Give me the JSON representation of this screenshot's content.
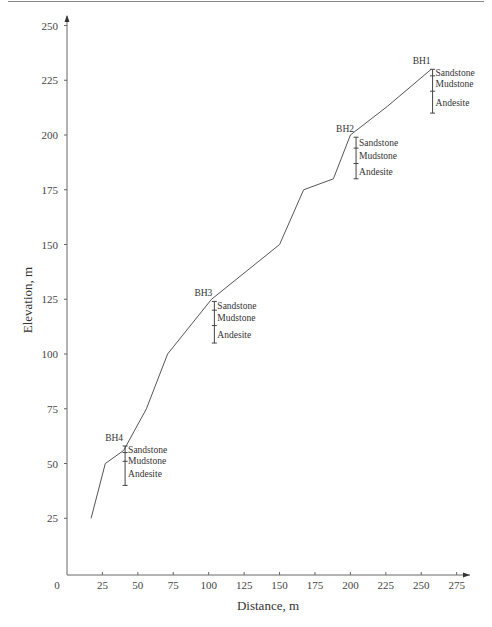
{
  "chart_data": {
    "type": "line",
    "title": "",
    "xlabel": "Distance, m",
    "ylabel": "Elevation, m",
    "xlim": [
      0,
      280
    ],
    "ylim": [
      0,
      250
    ],
    "x_ticks": [
      0,
      25,
      50,
      75,
      100,
      125,
      150,
      175,
      200,
      225,
      250,
      275
    ],
    "y_ticks": [
      25,
      50,
      75,
      100,
      125,
      150,
      175,
      200,
      225,
      250
    ],
    "grid": false,
    "series": [
      {
        "name": "Ground surface profile",
        "x": [
          17,
          27,
          40,
          56,
          71,
          102,
          150,
          167,
          188,
          200,
          226,
          257
        ],
        "y": [
          25,
          50,
          56,
          75,
          100,
          125,
          150,
          175,
          180,
          200,
          213,
          230
        ]
      }
    ],
    "boreholes": [
      {
        "name": "BH1",
        "x": 258,
        "top": 230,
        "bottom": 210,
        "layers": [
          {
            "name": "Sandstone",
            "top": 230,
            "bottom": 227
          },
          {
            "name": "Mudstone",
            "top": 227,
            "bottom": 220
          },
          {
            "name": "Andesite",
            "top": 220,
            "bottom": 210
          }
        ]
      },
      {
        "name": "BH2",
        "x": 204,
        "top": 199,
        "bottom": 180,
        "layers": [
          {
            "name": "Sandstone",
            "top": 199,
            "bottom": 194
          },
          {
            "name": "Mudstone",
            "top": 194,
            "bottom": 187
          },
          {
            "name": "Andesite",
            "top": 187,
            "bottom": 180
          }
        ]
      },
      {
        "name": "BH3",
        "x": 104,
        "top": 124,
        "bottom": 105,
        "layers": [
          {
            "name": "Sandstone",
            "top": 124,
            "bottom": 120
          },
          {
            "name": "Mudstone",
            "top": 120,
            "bottom": 113
          },
          {
            "name": "Andesite",
            "top": 113,
            "bottom": 105
          }
        ]
      },
      {
        "name": "BH4",
        "x": 41,
        "top": 58,
        "bottom": 40,
        "layers": [
          {
            "name": "Sandstone",
            "top": 58,
            "bottom": 55
          },
          {
            "name": "Mudstone",
            "top": 55,
            "bottom": 51
          },
          {
            "name": "Andesite",
            "top": 51,
            "bottom": 40
          }
        ]
      }
    ]
  },
  "colors": {
    "line": "#555555",
    "axis": "#666666",
    "text": "#333333"
  }
}
